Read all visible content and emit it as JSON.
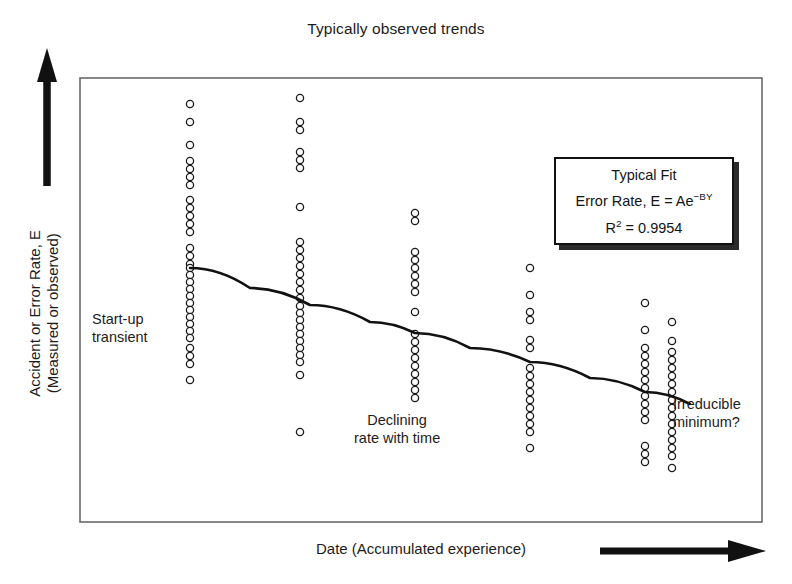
{
  "title": "Typically observed trends",
  "axes": {
    "y_label_line1": "Accident or Error Rate, E",
    "y_label_line2": "(Measured or observed)",
    "x_label": "Date (Accumulated experience)",
    "y_arrow_icon": "up-arrow-icon",
    "x_arrow_icon": "right-arrow-icon"
  },
  "legend": {
    "title": "Typical Fit",
    "formula_prefix": "Error Rate, E = Ae",
    "formula_exponent": "−BY",
    "r2_label": "R",
    "r2_superscript": "2",
    "r2_value": "= 0.9954"
  },
  "annotations": {
    "startup_line1": "Start-up",
    "startup_line2": "transient",
    "declining_line1": "Declining",
    "declining_line2": "rate with time",
    "irreducible_line1": "Irreducible",
    "irreducible_line2": "minimum?"
  },
  "colors": {
    "ink": "#111111",
    "frame": "#555555",
    "marker_stroke": "#1a1a1a",
    "background": "#ffffff"
  },
  "chart_data": {
    "type": "scatter",
    "title": "Typically observed trends",
    "xlabel": "Date (Accumulated experience)",
    "ylabel": "Accident or Error Rate, E (Measured or observed)",
    "grid": false,
    "legend_position": "upper-right",
    "axis_ticks": "none",
    "plot_frame_px": {
      "x0": 80,
      "y0": 78,
      "x1": 762,
      "y1": 522
    },
    "marker": {
      "shape": "open-circle",
      "radius_px": 3.6,
      "stroke_width_px": 1.3
    },
    "columns": [
      {
        "name": "column-1",
        "x_px": 190,
        "label": "Start-up transient",
        "y_px": [
          104,
          122,
          145,
          161,
          169,
          177,
          185,
          200,
          208,
          216,
          224,
          232,
          248,
          256,
          264,
          268,
          275,
          282,
          289,
          296,
          303,
          310,
          317,
          324,
          331,
          338,
          348,
          356,
          364,
          380
        ]
      },
      {
        "name": "column-2",
        "x_px": 300,
        "y_px": [
          98,
          122,
          130,
          152,
          160,
          168,
          207,
          242,
          250,
          258,
          266,
          274,
          282,
          290,
          298,
          306,
          313,
          320,
          327,
          334,
          341,
          348,
          355,
          362,
          375,
          432
        ]
      },
      {
        "name": "column-3",
        "x_px": 415,
        "y_px": [
          213,
          221,
          252,
          260,
          268,
          276,
          284,
          292,
          312,
          334,
          342,
          350,
          358,
          366,
          374,
          382,
          390,
          398
        ]
      },
      {
        "name": "column-4",
        "x_px": 530,
        "y_px": [
          268,
          295,
          312,
          320,
          340,
          348,
          368,
          376,
          384,
          392,
          400,
          408,
          416,
          424,
          432,
          448
        ]
      },
      {
        "name": "column-5",
        "x_px": 645,
        "y_px": [
          303,
          330,
          348,
          356,
          364,
          372,
          380,
          388,
          396,
          404,
          412,
          420,
          446,
          454,
          462
        ]
      },
      {
        "name": "column-6",
        "x_px": 672,
        "y_px": [
          322,
          341,
          352,
          360,
          368,
          376,
          384,
          392,
          400,
          408,
          416,
          424,
          432,
          440,
          448,
          456,
          468
        ]
      }
    ],
    "fit_curve": {
      "model": "E = Ae^(-BY)",
      "r_squared": 0.9954,
      "points_px": [
        [
          190,
          268
        ],
        [
          250,
          288
        ],
        [
          310,
          305
        ],
        [
          370,
          322
        ],
        [
          415,
          333
        ],
        [
          470,
          348
        ],
        [
          530,
          362
        ],
        [
          590,
          378
        ],
        [
          645,
          392
        ],
        [
          690,
          404
        ]
      ]
    }
  }
}
